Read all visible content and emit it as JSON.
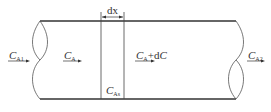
{
  "diagram": {
    "type": "tubular-reactor-differential-element",
    "stroke_color": "#333333",
    "labels": {
      "inlet": {
        "main": "C",
        "sub": "A1"
      },
      "bulk": {
        "main": "C",
        "sub": "A"
      },
      "outlet_of_element": {
        "main": "C",
        "sub": "A",
        "suffix": "+d",
        "suffix_var": "C"
      },
      "outlet": {
        "main": "C",
        "sub": "A2"
      },
      "surface": {
        "main": "C",
        "sub": "As"
      },
      "element_width": "dx"
    }
  }
}
